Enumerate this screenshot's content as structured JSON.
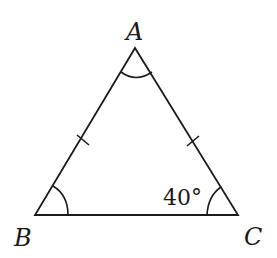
{
  "diagram": {
    "type": "isosceles-triangle",
    "vertices": {
      "A": {
        "label": "A"
      },
      "B": {
        "label": "B"
      },
      "C": {
        "label": "C"
      }
    },
    "equal_sides": [
      "AB",
      "AC"
    ],
    "angle_marks": [
      "A",
      "B",
      "C"
    ],
    "angle_C_label": "40°",
    "colors": {
      "stroke": "#1a1a1a",
      "background": "#ffffff"
    }
  }
}
